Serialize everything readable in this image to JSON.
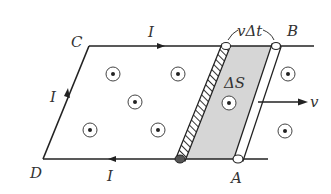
{
  "diagram": {
    "type": "physics-circuit-moving-rod",
    "labels": {
      "corner_c": "C",
      "corner_d": "D",
      "corner_a": "A",
      "corner_b": "B",
      "current_top": "I",
      "current_left": "I",
      "current_bottom": "I",
      "displacement": "vΔt",
      "area": "ΔS",
      "velocity": "v"
    },
    "field_symbol": "dot-out-of-page",
    "colors": {
      "line": "#222222",
      "shade": "#d6d6d6",
      "background": "#ffffff"
    }
  }
}
